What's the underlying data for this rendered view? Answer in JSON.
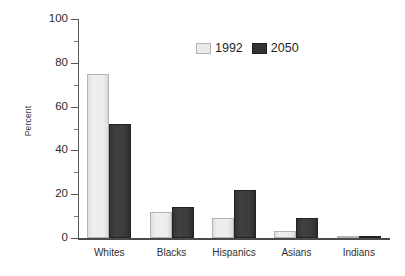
{
  "chart_data": {
    "type": "bar",
    "title": "",
    "subtitle": "",
    "xlabel": "",
    "ylabel": "Percent",
    "categories": [
      "Whites",
      "Blacks",
      "Hispanics",
      "Asians",
      "Indians"
    ],
    "series": [
      {
        "name": "1992",
        "color": "#e9e9e9",
        "values": [
          75,
          12,
          9,
          3,
          0.6
        ]
      },
      {
        "name": "2050",
        "color": "#333333",
        "values": [
          52,
          14,
          22,
          9,
          0.8
        ]
      }
    ],
    "ylim": [
      0,
      100
    ],
    "ytick_labels": [
      "0",
      "20",
      "40",
      "60",
      "80",
      "100"
    ],
    "ytick_values": [
      0,
      20,
      40,
      60,
      80,
      100
    ],
    "yminor_values": [
      10,
      30,
      50,
      70,
      90
    ],
    "grid": false,
    "legend_position": "top-center",
    "legend_entries": [
      "1992",
      "2050"
    ]
  },
  "axes": {
    "y_title": "Percent"
  },
  "legend": {
    "items": [
      {
        "label": "1992",
        "swatch": "legend-swatch-1992"
      },
      {
        "label": "2050",
        "swatch": "legend-swatch-2050"
      }
    ]
  }
}
